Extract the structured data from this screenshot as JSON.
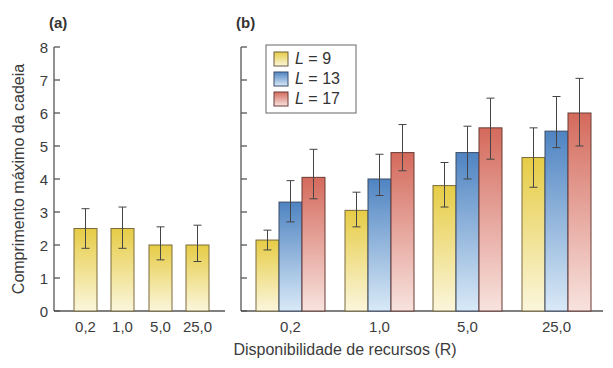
{
  "chart_data": [
    {
      "panel": "(a)",
      "type": "bar",
      "title": "",
      "xlabel": "Disponibilidade de recursos (R)",
      "ylabel": "Comprimento máximo da cadeia",
      "ylim": [
        0,
        8
      ],
      "yticks": [
        0,
        1,
        2,
        3,
        4,
        5,
        6,
        7,
        8
      ],
      "categories": [
        "0,2",
        "1,0",
        "5,0",
        "25,0"
      ],
      "series": [
        {
          "name": "L = 9",
          "color": "#e9d257",
          "values": [
            2.5,
            2.5,
            2.0,
            2.0
          ],
          "error_upper": [
            3.1,
            3.15,
            2.55,
            2.6
          ],
          "error_lower": [
            1.9,
            1.9,
            1.55,
            1.5
          ]
        }
      ],
      "grid": false,
      "legend": "none"
    },
    {
      "panel": "(b)",
      "type": "bar",
      "title": "",
      "xlabel": "Disponibilidade de recursos (R)",
      "ylabel": "Comprimento máximo da cadeia",
      "ylim": [
        0,
        8
      ],
      "yticks": [
        0,
        1,
        2,
        3,
        4,
        5,
        6,
        7,
        8
      ],
      "categories": [
        "0,2",
        "1,0",
        "5,0",
        "25,0"
      ],
      "series": [
        {
          "name": "L = 9",
          "color": "#e9d257",
          "values": [
            2.15,
            3.05,
            3.8,
            4.65
          ],
          "error_upper": [
            2.45,
            3.6,
            4.5,
            5.55
          ],
          "error_lower": [
            1.85,
            2.55,
            3.15,
            3.75
          ]
        },
        {
          "name": "L = 13",
          "color": "#5b8fc9",
          "values": [
            3.3,
            4.0,
            4.8,
            5.45
          ],
          "error_upper": [
            3.95,
            4.75,
            5.6,
            6.5
          ],
          "error_lower": [
            2.7,
            3.5,
            4.0,
            4.95
          ]
        },
        {
          "name": "L = 17",
          "color": "#d87a6c",
          "values": [
            4.05,
            4.8,
            5.55,
            6.0
          ],
          "error_upper": [
            4.9,
            5.65,
            6.45,
            7.05
          ],
          "error_lower": [
            3.4,
            4.25,
            4.6,
            5.0
          ]
        }
      ],
      "grid": false,
      "legend": "top-left inside"
    }
  ],
  "labels": {
    "panel_a": "(a)",
    "panel_b": "(b)",
    "ylabel": "Comprimento máximo da cadeia",
    "xlabel": "Disponibilidade de recursos (R)",
    "legend": [
      {
        "prefix": "L",
        "suffix": " = 9"
      },
      {
        "prefix": "L",
        "suffix": " = 13"
      },
      {
        "prefix": "L",
        "suffix": " = 17"
      }
    ]
  }
}
